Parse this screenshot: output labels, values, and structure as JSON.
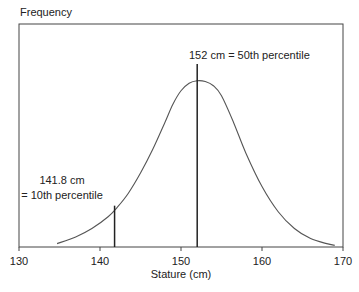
{
  "chart_data": {
    "type": "line",
    "title": "",
    "ylabel": "Frequency",
    "xlabel": "Stature (cm)",
    "xlim": [
      130,
      170
    ],
    "ylim": [
      0,
      1
    ],
    "x_ticks": [
      130,
      140,
      150,
      160,
      170
    ],
    "x_tick_labels": [
      "130",
      "140",
      "150",
      "160",
      "170"
    ],
    "grid": false,
    "series": [
      {
        "name": "Stature distribution",
        "x": [
          134.7,
          137,
          139,
          141,
          142.2,
          143.5,
          145,
          146.5,
          148,
          149,
          150,
          151,
          152,
          153,
          154,
          155,
          156.5,
          158,
          160,
          162,
          164,
          166,
          168,
          169
        ],
        "y": [
          0.02,
          0.06,
          0.11,
          0.18,
          0.24,
          0.32,
          0.44,
          0.58,
          0.74,
          0.85,
          0.93,
          0.975,
          0.99,
          0.985,
          0.96,
          0.9,
          0.74,
          0.56,
          0.36,
          0.21,
          0.11,
          0.05,
          0.02,
          0.01
        ]
      }
    ],
    "annotations": [
      {
        "x": 141.8,
        "line_top": 0.24,
        "label_lines": [
          "141.8 cm",
          "= 10th percentile"
        ]
      },
      {
        "x": 152,
        "line_top": 1.12,
        "label_lines": [
          "152 cm = 50th percentile"
        ]
      }
    ]
  }
}
